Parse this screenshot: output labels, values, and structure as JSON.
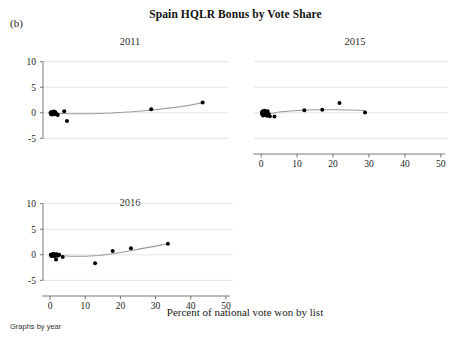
{
  "figure": {
    "panel_label": "(b)",
    "title": "Spain HQLR Bonus by Vote Share",
    "xaxis_title": "Percent of national vote won by list",
    "footnote": "Graphs by year"
  },
  "chart_data": {
    "type": "scatter",
    "title": "Spain HQLR Bonus by Vote Share",
    "xlabel": "Percent of national vote won by list",
    "ylabel": "",
    "xlim": [
      -2,
      52
    ],
    "ylim": [
      -6.5,
      11.5
    ],
    "xticks": [
      0,
      10,
      20,
      30,
      40,
      50
    ],
    "yticks": [
      -5,
      0,
      5,
      10
    ],
    "xtick_labels": [
      "0",
      "10",
      "20",
      "30",
      "40",
      "50"
    ],
    "ytick_labels": [
      "-5",
      "0",
      "5",
      "10"
    ],
    "grid": "horizontal",
    "legend": "none",
    "facet_by": "year",
    "panels": [
      {
        "label": "2011",
        "points": [
          {
            "x": 0.2,
            "y": 0.0
          },
          {
            "x": 0.3,
            "y": -0.25
          },
          {
            "x": 0.5,
            "y": 0.15
          },
          {
            "x": 0.6,
            "y": -0.35
          },
          {
            "x": 0.8,
            "y": 0.05
          },
          {
            "x": 1.0,
            "y": -0.1
          },
          {
            "x": 1.2,
            "y": 0.25
          },
          {
            "x": 1.4,
            "y": -0.3
          },
          {
            "x": 1.6,
            "y": 0.1
          },
          {
            "x": 1.9,
            "y": -0.2
          },
          {
            "x": 2.3,
            "y": -0.45
          },
          {
            "x": 4.2,
            "y": 0.3
          },
          {
            "x": 5.0,
            "y": -1.6
          },
          {
            "x": 29.6,
            "y": 0.7
          },
          {
            "x": 44.6,
            "y": 2.0
          }
        ],
        "fit": [
          {
            "x": 2.0,
            "y": -0.12
          },
          {
            "x": 6.0,
            "y": -0.2
          },
          {
            "x": 12.0,
            "y": -0.18
          },
          {
            "x": 18.0,
            "y": -0.05
          },
          {
            "x": 24.0,
            "y": 0.2
          },
          {
            "x": 30.0,
            "y": 0.55
          },
          {
            "x": 36.0,
            "y": 1.0
          },
          {
            "x": 41.0,
            "y": 1.5
          },
          {
            "x": 44.8,
            "y": 2.0
          }
        ]
      },
      {
        "label": "2015",
        "points": [
          {
            "x": 0.2,
            "y": 0.05
          },
          {
            "x": 0.3,
            "y": -0.3
          },
          {
            "x": 0.4,
            "y": 0.3
          },
          {
            "x": 0.5,
            "y": -0.55
          },
          {
            "x": 0.7,
            "y": 0.15
          },
          {
            "x": 0.9,
            "y": -0.15
          },
          {
            "x": 1.0,
            "y": 0.4
          },
          {
            "x": 1.2,
            "y": -0.45
          },
          {
            "x": 1.4,
            "y": 0.1
          },
          {
            "x": 1.6,
            "y": -0.6
          },
          {
            "x": 1.8,
            "y": 0.3
          },
          {
            "x": 2.1,
            "y": -0.25
          },
          {
            "x": 2.4,
            "y": -0.7
          },
          {
            "x": 3.7,
            "y": -0.75
          },
          {
            "x": 12.0,
            "y": 0.5
          },
          {
            "x": 17.0,
            "y": 0.6
          },
          {
            "x": 21.8,
            "y": 1.9
          },
          {
            "x": 28.9,
            "y": 0.05
          }
        ],
        "fit": [
          {
            "x": 1.5,
            "y": -0.3
          },
          {
            "x": 5.0,
            "y": 0.15
          },
          {
            "x": 9.0,
            "y": 0.4
          },
          {
            "x": 13.0,
            "y": 0.55
          },
          {
            "x": 17.0,
            "y": 0.6
          },
          {
            "x": 21.0,
            "y": 0.6
          },
          {
            "x": 25.0,
            "y": 0.55
          },
          {
            "x": 29.0,
            "y": 0.45
          }
        ]
      },
      {
        "label": "2016",
        "points": [
          {
            "x": 0.2,
            "y": 0.0
          },
          {
            "x": 0.4,
            "y": -0.25
          },
          {
            "x": 0.6,
            "y": 0.1
          },
          {
            "x": 0.8,
            "y": -0.15
          },
          {
            "x": 1.0,
            "y": 0.15
          },
          {
            "x": 1.3,
            "y": -0.3
          },
          {
            "x": 1.5,
            "y": 0.05
          },
          {
            "x": 1.7,
            "y": -0.9
          },
          {
            "x": 1.9,
            "y": 0.1
          },
          {
            "x": 2.2,
            "y": -0.2
          },
          {
            "x": 2.6,
            "y": 0.0
          },
          {
            "x": 3.6,
            "y": -0.45
          },
          {
            "x": 12.8,
            "y": -1.65
          },
          {
            "x": 17.8,
            "y": 0.75
          },
          {
            "x": 23.0,
            "y": 1.3
          },
          {
            "x": 33.5,
            "y": 2.15
          }
        ],
        "fit": [
          {
            "x": 2.0,
            "y": -0.15
          },
          {
            "x": 6.0,
            "y": -0.3
          },
          {
            "x": 10.0,
            "y": -0.3
          },
          {
            "x": 14.0,
            "y": -0.15
          },
          {
            "x": 18.0,
            "y": 0.2
          },
          {
            "x": 22.0,
            "y": 0.7
          },
          {
            "x": 26.0,
            "y": 1.2
          },
          {
            "x": 30.0,
            "y": 1.7
          },
          {
            "x": 33.6,
            "y": 2.15
          }
        ]
      }
    ]
  }
}
